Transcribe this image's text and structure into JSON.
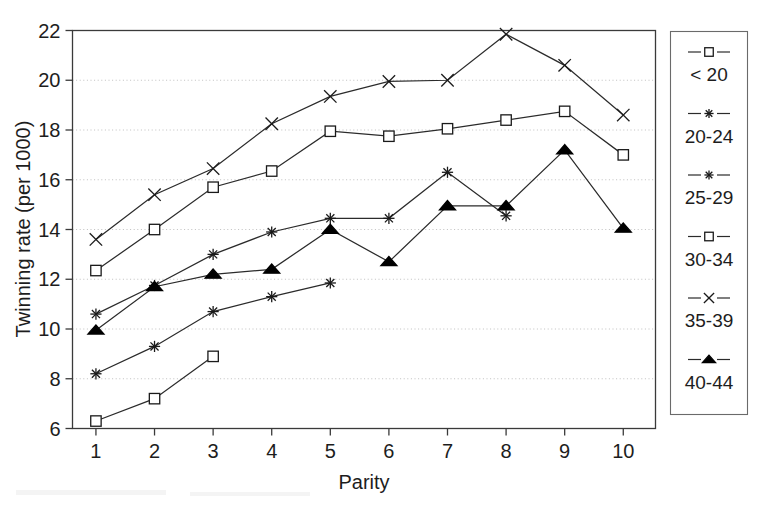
{
  "chart_data": {
    "type": "line",
    "title": "",
    "xlabel": "Parity",
    "ylabel": "Twinning rate (per 1000)",
    "x": [
      1,
      2,
      3,
      4,
      5,
      6,
      7,
      8,
      9,
      10
    ],
    "xlim": [
      0.6,
      10.55
    ],
    "ylim": [
      6,
      22
    ],
    "yticks": [
      6,
      8,
      10,
      12,
      14,
      16,
      18,
      20,
      22
    ],
    "xticks": [
      1,
      2,
      3,
      4,
      5,
      6,
      7,
      8,
      9,
      10
    ],
    "grid": "horizontal-dotted",
    "legend_position": "right-outside",
    "series": [
      {
        "name": "< 20",
        "marker": "open-square",
        "x": [
          1,
          2,
          3
        ],
        "values": [
          6.3,
          7.2,
          8.9
        ]
      },
      {
        "name": "20-24",
        "marker": "asterisk",
        "x": [
          1,
          2,
          3,
          4,
          5
        ],
        "values": [
          8.2,
          9.3,
          10.7,
          11.3,
          11.85
        ]
      },
      {
        "name": "25-29",
        "marker": "asterisk",
        "x": [
          1,
          2,
          3,
          4,
          5,
          6,
          7,
          8
        ],
        "values": [
          10.6,
          11.75,
          13.0,
          13.9,
          14.45,
          14.45,
          16.3,
          14.55
        ]
      },
      {
        "name": "30-34",
        "marker": "open-square",
        "x": [
          1,
          2,
          3,
          4,
          5,
          6,
          7,
          8,
          9,
          10
        ],
        "values": [
          12.35,
          14.0,
          15.7,
          16.35,
          17.95,
          17.75,
          18.05,
          18.4,
          18.75,
          17.0
        ]
      },
      {
        "name": "35-39",
        "marker": "cross-x",
        "x": [
          1,
          2,
          3,
          4,
          5,
          6,
          7,
          8,
          9,
          10
        ],
        "values": [
          13.6,
          15.4,
          16.45,
          18.25,
          19.35,
          19.95,
          20.0,
          21.85,
          20.6,
          18.6
        ]
      },
      {
        "name": "40-44",
        "marker": "solid-triangle",
        "x": [
          1,
          2,
          3,
          4,
          5,
          6,
          7,
          8,
          9,
          10
        ],
        "values": [
          9.95,
          11.7,
          12.2,
          12.4,
          14.0,
          12.7,
          14.95,
          14.95,
          17.2,
          14.05
        ]
      }
    ]
  },
  "axes": {
    "y_title": "Twinning rate (per 1000)",
    "x_title": "Parity",
    "y_tick_labels": [
      "6",
      "8",
      "10",
      "12",
      "14",
      "16",
      "18",
      "20",
      "22"
    ],
    "x_tick_labels": [
      "1",
      "2",
      "3",
      "4",
      "5",
      "6",
      "7",
      "8",
      "9",
      "10"
    ]
  },
  "legend": {
    "entries": [
      {
        "label": "< 20",
        "marker": "open-square"
      },
      {
        "label": "20-24",
        "marker": "asterisk"
      },
      {
        "label": "25-29",
        "marker": "asterisk"
      },
      {
        "label": "30-34",
        "marker": "open-square"
      },
      {
        "label": "35-39",
        "marker": "cross-x"
      },
      {
        "label": "40-44",
        "marker": "solid-triangle"
      }
    ]
  },
  "colors": {
    "ink": "#1a1a1a",
    "line": "#2b2b2b",
    "grid": "#b9b9b9",
    "background": "#ffffff"
  }
}
